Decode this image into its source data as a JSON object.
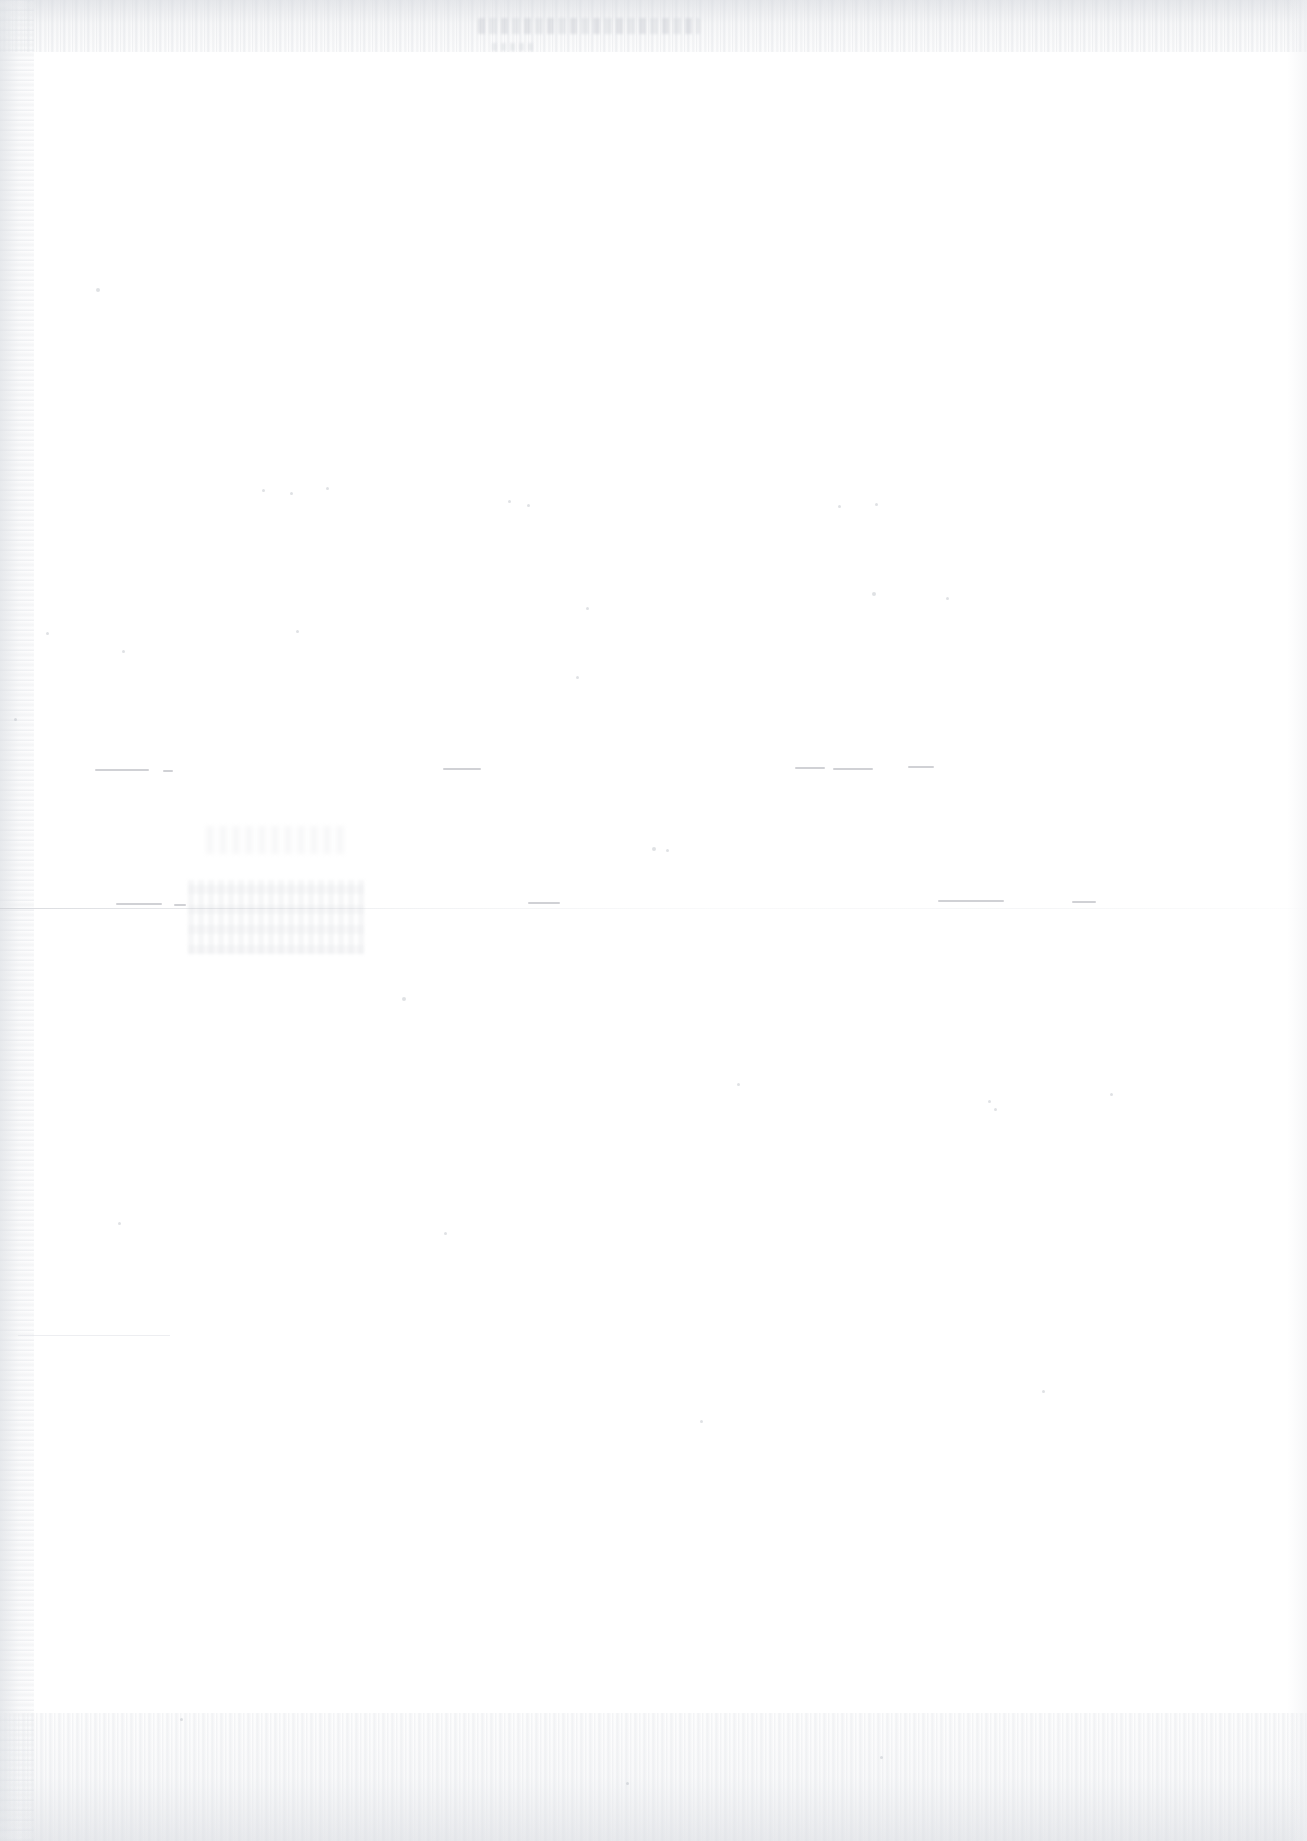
{
  "page": {
    "kind": "scanned-document-page",
    "condition": "heavily faded / washed out scan",
    "width_px": 1307,
    "height_px": 1841,
    "background_color": "#ffffff",
    "ink_color": "#969aa2",
    "legible_text": "",
    "note": "No legible text is rendered in the pixels; the page is effectively blank white with residual scan artifacts."
  },
  "artifacts": {
    "header_line": {
      "name": "faded-header-text",
      "text": "",
      "left": 478,
      "top": 18,
      "width": 222,
      "height": 16
    },
    "header_subline": {
      "name": "faded-header-subtext",
      "text": "",
      "left": 492,
      "top": 43,
      "width": 42,
      "height": 8
    },
    "horizontal_rule": {
      "name": "page-divider-rule",
      "top": 908,
      "left": 0,
      "width": 1307,
      "height": 1
    },
    "smudge_primary": {
      "name": "illegible-text-smudge",
      "text": "",
      "left": 188,
      "top": 880,
      "width": 176,
      "height": 74
    },
    "smudge_secondary": {
      "name": "illegible-text-smudge-upper",
      "text": "",
      "left": 206,
      "top": 826,
      "width": 140,
      "height": 28
    },
    "dashes": [
      {
        "name": "dash-fragment-1",
        "left": 95,
        "top": 769,
        "width": 54
      },
      {
        "name": "dash-fragment-2",
        "left": 163,
        "top": 770,
        "width": 10
      },
      {
        "name": "dash-fragment-3",
        "left": 443,
        "top": 768,
        "width": 38
      },
      {
        "name": "dash-fragment-4",
        "left": 795,
        "top": 767,
        "width": 30
      },
      {
        "name": "dash-fragment-5",
        "left": 833,
        "top": 768,
        "width": 40
      },
      {
        "name": "dash-fragment-6",
        "left": 908,
        "top": 766,
        "width": 26
      },
      {
        "name": "dash-fragment-7",
        "left": 116,
        "top": 903,
        "width": 46
      },
      {
        "name": "dash-fragment-8",
        "left": 174,
        "top": 904,
        "width": 12
      },
      {
        "name": "dash-fragment-9",
        "left": 528,
        "top": 902,
        "width": 32
      },
      {
        "name": "dash-fragment-10",
        "left": 938,
        "top": 900,
        "width": 66
      },
      {
        "name": "dash-fragment-11",
        "left": 1072,
        "top": 901,
        "width": 24
      }
    ],
    "short_rules": [
      {
        "name": "faint-rule-bottom-left",
        "left": 18,
        "top": 1335,
        "width": 152
      }
    ],
    "specks": [
      {
        "name": "speck-1",
        "left": 96,
        "top": 288,
        "size": 4
      },
      {
        "name": "speck-2",
        "left": 122,
        "top": 650,
        "size": 3
      },
      {
        "name": "speck-3",
        "left": 46,
        "top": 632,
        "size": 3
      },
      {
        "name": "speck-4",
        "left": 14,
        "top": 718,
        "size": 3
      },
      {
        "name": "speck-5",
        "left": 262,
        "top": 489,
        "size": 3
      },
      {
        "name": "speck-6",
        "left": 290,
        "top": 492,
        "size": 3
      },
      {
        "name": "speck-7",
        "left": 326,
        "top": 487,
        "size": 3
      },
      {
        "name": "speck-8",
        "left": 296,
        "top": 630,
        "size": 3
      },
      {
        "name": "speck-9",
        "left": 508,
        "top": 500,
        "size": 3
      },
      {
        "name": "speck-10",
        "left": 527,
        "top": 504,
        "size": 3
      },
      {
        "name": "speck-11",
        "left": 576,
        "top": 676,
        "size": 3
      },
      {
        "name": "speck-12",
        "left": 586,
        "top": 607,
        "size": 3
      },
      {
        "name": "speck-13",
        "left": 652,
        "top": 847,
        "size": 4
      },
      {
        "name": "speck-14",
        "left": 666,
        "top": 849,
        "size": 3
      },
      {
        "name": "speck-15",
        "left": 838,
        "top": 505,
        "size": 3
      },
      {
        "name": "speck-16",
        "left": 872,
        "top": 592,
        "size": 4
      },
      {
        "name": "speck-17",
        "left": 875,
        "top": 503,
        "size": 3
      },
      {
        "name": "speck-18",
        "left": 946,
        "top": 597,
        "size": 3
      },
      {
        "name": "speck-19",
        "left": 402,
        "top": 997,
        "size": 4
      },
      {
        "name": "speck-20",
        "left": 737,
        "top": 1083,
        "size": 3
      },
      {
        "name": "speck-21",
        "left": 988,
        "top": 1100,
        "size": 3
      },
      {
        "name": "speck-22",
        "left": 994,
        "top": 1108,
        "size": 3
      },
      {
        "name": "speck-23",
        "left": 1110,
        "top": 1093,
        "size": 3
      },
      {
        "name": "speck-24",
        "left": 118,
        "top": 1222,
        "size": 3
      },
      {
        "name": "speck-25",
        "left": 444,
        "top": 1232,
        "size": 3
      },
      {
        "name": "speck-26",
        "left": 700,
        "top": 1420,
        "size": 3
      },
      {
        "name": "speck-27",
        "left": 1042,
        "top": 1390,
        "size": 3
      },
      {
        "name": "speck-28",
        "left": 180,
        "top": 1718,
        "size": 3
      },
      {
        "name": "speck-29",
        "left": 880,
        "top": 1756,
        "size": 3
      },
      {
        "name": "speck-30",
        "left": 626,
        "top": 1782,
        "size": 3
      }
    ]
  }
}
